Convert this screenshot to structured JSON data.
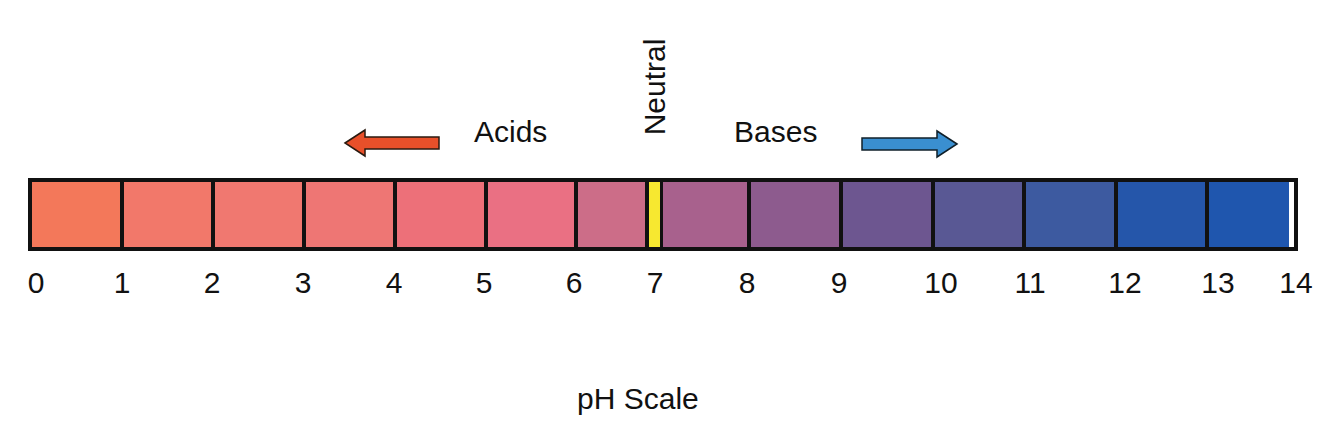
{
  "diagram": {
    "title": "pH Scale",
    "labels": {
      "acids": "Acids",
      "bases": "Bases",
      "neutral": "Neutral"
    },
    "arrows": {
      "acids": {
        "direction": "left",
        "color": "#e8502a"
      },
      "bases": {
        "direction": "right",
        "color": "#3a8fd0"
      }
    },
    "neutral_marker_color": "#f7e830",
    "border_color": "#111111",
    "ticks": [
      "0",
      "1",
      "2",
      "3",
      "4",
      "5",
      "6",
      "7",
      "8",
      "9",
      "10",
      "11",
      "12",
      "13",
      "14"
    ],
    "cells": [
      {
        "range": "0-1",
        "color": "#f3785a"
      },
      {
        "range": "1-2",
        "color": "#f2786a"
      },
      {
        "range": "2-3",
        "color": "#f07870"
      },
      {
        "range": "3-4",
        "color": "#ee7674"
      },
      {
        "range": "4-5",
        "color": "#ed7079"
      },
      {
        "range": "5-6",
        "color": "#ea7083"
      },
      {
        "range": "6-7",
        "color": "#cc6d88"
      },
      {
        "range": "7-8",
        "color": "#a8618d"
      },
      {
        "range": "8-9",
        "color": "#8d5b8e"
      },
      {
        "range": "9-10",
        "color": "#6d5690"
      },
      {
        "range": "10-11",
        "color": "#595894"
      },
      {
        "range": "11-12",
        "color": "#3d5aa0"
      },
      {
        "range": "12-13",
        "color": "#2556aa"
      },
      {
        "range": "13-14",
        "color": "#1f56ae"
      }
    ]
  }
}
